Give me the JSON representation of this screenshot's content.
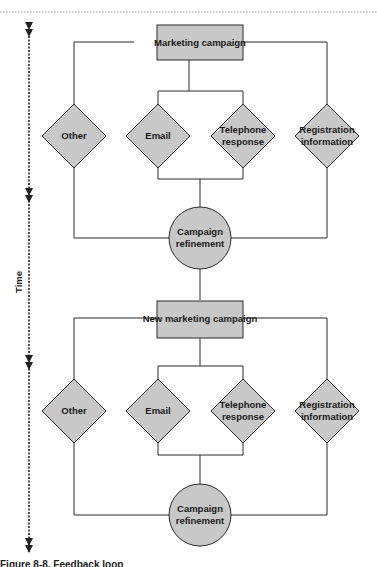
{
  "diagram": {
    "type": "flowchart",
    "colors": {
      "node_fill": "#c8c8c8",
      "stroke": "#2a2a2a",
      "dotted_rule": "#999999"
    },
    "time_axis": {
      "label": "Time",
      "arrow_positions_y": [
        22,
        190,
        360,
        548
      ]
    },
    "cycles": [
      {
        "campaign": "Marketing campaign",
        "channels": [
          "Other",
          "Email",
          "Telephone response",
          "Registration information"
        ],
        "refinement": "Campaign refinement"
      },
      {
        "campaign": "New marketing campaign",
        "channels": [
          "Other",
          "Email",
          "Telephone response",
          "Registration information"
        ],
        "refinement": "Campaign refinement"
      }
    ],
    "text": {
      "c1_campaign": "Marketing campaign",
      "c1_other": "Other",
      "c1_email": "Email",
      "c1_tel_1": "Telephone",
      "c1_tel_2": "response",
      "c1_reg_1": "Registration",
      "c1_reg_2": "information",
      "c1_ref_1": "Campaign",
      "c1_ref_2": "refinement",
      "c2_campaign": "New marketing campaign",
      "c2_other": "Other",
      "c2_email": "Email",
      "c2_tel_1": "Telephone",
      "c2_tel_2": "response",
      "c2_reg_1": "Registration",
      "c2_reg_2": "information",
      "c2_ref_1": "Campaign",
      "c2_ref_2": "refinement",
      "time": "Time"
    },
    "caption": "Figure 8-8. Feedback loop"
  }
}
